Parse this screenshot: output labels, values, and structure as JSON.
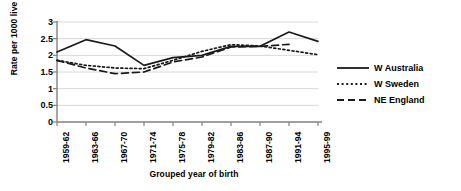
{
  "chart_data": {
    "type": "line",
    "title": "",
    "xlabel": "Grouped year of birth",
    "ylabel": "Rate per 1000 live births",
    "ylabel_superscript": "2",
    "categories": [
      "1959-62",
      "1963-66",
      "1967-70",
      "1971-74",
      "1975-78",
      "1979-82",
      "1983-86",
      "1987-90",
      "1991-94",
      "1995-99"
    ],
    "ylim": [
      0,
      3
    ],
    "yticks": [
      "0",
      "0.5",
      "1",
      "1.5",
      "2",
      "2.5",
      "3"
    ],
    "ytick_values": [
      0,
      0.5,
      1,
      1.5,
      2,
      2.5,
      3
    ],
    "grid": true,
    "legend_position": "right",
    "series": [
      {
        "name": "W Australia",
        "style": "solid",
        "color": "#1a1a1a",
        "values": [
          2.1,
          2.47,
          2.28,
          1.7,
          1.93,
          2.0,
          2.27,
          2.27,
          2.7,
          2.42
        ]
      },
      {
        "name": "W Sweden",
        "style": "dotted",
        "color": "#1a1a1a",
        "values": [
          1.85,
          1.7,
          1.62,
          1.6,
          1.85,
          2.12,
          2.32,
          2.28,
          2.15,
          2.02
        ]
      },
      {
        "name": "NE England",
        "style": "dashed",
        "color": "#1a1a1a",
        "values": [
          1.85,
          1.62,
          1.45,
          1.5,
          1.8,
          1.95,
          2.25,
          2.27,
          2.33,
          null
        ]
      }
    ]
  },
  "legend": {
    "items": [
      {
        "label": "W Australia"
      },
      {
        "label": "W Sweden"
      },
      {
        "label": "NE England"
      }
    ]
  }
}
